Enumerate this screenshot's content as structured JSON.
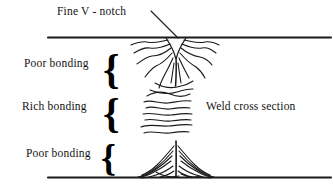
{
  "figure": {
    "title": "Weld cross section",
    "type": "technical-line-diagram",
    "background_color": "#ffffff",
    "stroke_color": "#1a1a1a"
  },
  "labels": {
    "fine_v_notch": "Fine V - notch",
    "poor_bonding_top": "Poor bonding",
    "rich_bonding": "Rich bonding",
    "poor_bonding_bottom": "Poor bonding",
    "weld_cross_section": "Weld cross section"
  },
  "braces": {
    "top": "{",
    "middle": "{",
    "bottom": "{"
  },
  "geometry": {
    "top_boundary_line": {
      "x1": 48,
      "y1": 37,
      "x2": 330,
      "y2": 37
    },
    "bottom_boundary_line": {
      "x1": 48,
      "y1": 177,
      "x2": 330,
      "y2": 177
    },
    "leader_line": {
      "x1": 152,
      "y1": 12,
      "x2": 178,
      "y2": 38
    },
    "notch_apex_x": 176,
    "zones": [
      {
        "name": "poor-bonding-top",
        "y_range": [
          37,
          88
        ]
      },
      {
        "name": "rich-bonding",
        "y_range": [
          88,
          134
        ]
      },
      {
        "name": "poor-bonding-bottom",
        "y_range": [
          134,
          177
        ]
      }
    ]
  }
}
